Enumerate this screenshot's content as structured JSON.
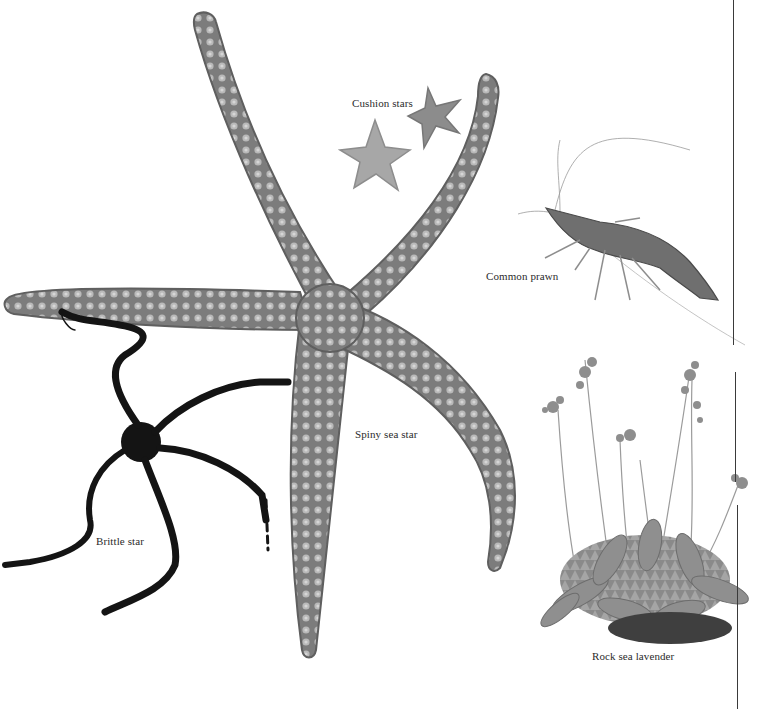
{
  "plate": {
    "background": "#ffffff",
    "caption_color": "#2b2b2b",
    "divider_color": "#3a3a3a"
  },
  "specimens": {
    "cushion_stars": {
      "label": "Cushion stars",
      "icon": "cushion-star-icon",
      "color": "#8f8f8f"
    },
    "common_prawn": {
      "label": "Common prawn",
      "icon": "prawn-icon",
      "color": "#6f6f6f"
    },
    "spiny_sea_star": {
      "label": "Spiny sea star",
      "icon": "starfish-icon",
      "color": "#7a7a7a"
    },
    "brittle_star": {
      "label": "Brittle star",
      "icon": "brittle-star-icon",
      "color": "#1a1a1a"
    },
    "rock_sea_lavender": {
      "label": "Rock sea lavender",
      "icon": "plant-icon",
      "color": "#858585"
    }
  }
}
